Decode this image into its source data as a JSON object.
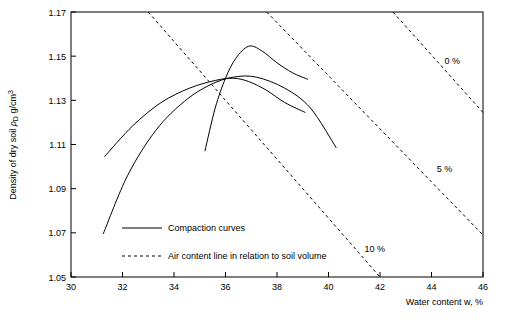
{
  "chart_data": {
    "type": "line",
    "title": "",
    "xlabel": "Water content w, %",
    "ylabel_parts": {
      "main": "Density of dry soil ",
      "symbol": "ρ",
      "subscript": "D",
      "units": " g/cm",
      "superscript": "3"
    },
    "xlim": [
      30,
      46
    ],
    "ylim": [
      1.05,
      1.17
    ],
    "xticks": [
      30,
      32,
      34,
      36,
      38,
      40,
      42,
      44,
      46
    ],
    "yticks": [
      1.05,
      1.07,
      1.09,
      1.11,
      1.13,
      1.15,
      1.17
    ],
    "xtick_labels": [
      "30",
      "32",
      "34",
      "36",
      "38",
      "40",
      "42",
      "44",
      "46"
    ],
    "ytick_labels": [
      "1.05",
      "1.07",
      "1.09",
      "1.11",
      "1.13",
      "1.15",
      "1.17"
    ],
    "grid": false,
    "legend_position": "inside-bottom-left",
    "legend": [
      {
        "label": "Compaction curves",
        "style": "solid",
        "name": "legend-compaction-curves"
      },
      {
        "label": "Air content line in relation to soil volume",
        "style": "dashed",
        "name": "legend-air-content-line"
      }
    ],
    "annotations": [
      {
        "text": "0 %",
        "x": 44.5,
        "y": 1.1465,
        "name": "annotation-0-percent"
      },
      {
        "text": "5 %",
        "x": 44.2,
        "y": 1.0975,
        "name": "annotation-5-percent"
      },
      {
        "text": "10 %",
        "x": 41.4,
        "y": 1.0615,
        "name": "annotation-10-percent"
      }
    ],
    "series": [
      {
        "name": "compaction-curve-1",
        "style": "solid",
        "points": [
          [
            31.25,
            1.0695
          ],
          [
            32.2,
            1.096
          ],
          [
            33.3,
            1.1165
          ],
          [
            34.4,
            1.1295
          ],
          [
            35.4,
            1.137
          ],
          [
            36.3,
            1.1405
          ],
          [
            37.2,
            1.1405
          ],
          [
            38.3,
            1.1355
          ],
          [
            39.3,
            1.1265
          ],
          [
            40.3,
            1.1085
          ]
        ]
      },
      {
        "name": "compaction-curve-2",
        "style": "solid",
        "points": [
          [
            35.2,
            1.107
          ],
          [
            35.6,
            1.1265
          ],
          [
            36.0,
            1.14
          ],
          [
            36.4,
            1.149
          ],
          [
            36.9,
            1.1545
          ],
          [
            37.4,
            1.1525
          ],
          [
            38.0,
            1.147
          ],
          [
            38.6,
            1.1425
          ],
          [
            39.2,
            1.1395
          ]
        ]
      },
      {
        "name": "compaction-curve-3",
        "style": "solid",
        "points": [
          [
            31.3,
            1.1045
          ],
          [
            32.4,
            1.1185
          ],
          [
            33.5,
            1.129
          ],
          [
            34.6,
            1.1355
          ],
          [
            35.6,
            1.139
          ],
          [
            36.3,
            1.14
          ],
          [
            36.9,
            1.1385
          ],
          [
            37.6,
            1.1345
          ],
          [
            38.3,
            1.129
          ],
          [
            39.1,
            1.1245
          ]
        ]
      },
      {
        "name": "air-content-line-0-percent",
        "style": "dashed",
        "points": [
          [
            33.0,
            1.17
          ],
          [
            42.0,
            1.05
          ]
        ]
      },
      {
        "name": "air-content-line-5-percent",
        "style": "dashed",
        "points": [
          [
            37.6,
            1.17
          ],
          [
            46.0,
            1.069
          ]
        ]
      },
      {
        "name": "air-content-line-10-percent",
        "style": "dashed",
        "points": [
          [
            42.5,
            1.17
          ],
          [
            46.0,
            1.1245
          ]
        ]
      }
    ]
  }
}
